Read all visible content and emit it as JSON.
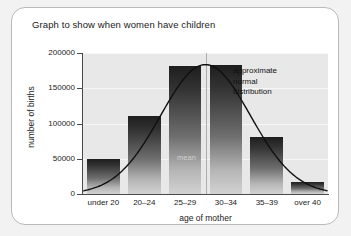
{
  "chart_data": {
    "type": "bar",
    "title": "Graph to show when women have children",
    "xlabel": "age of mother",
    "ylabel": "number of births",
    "categories": [
      "under 20",
      "20–24",
      "25–29",
      "30–34",
      "35–39",
      "over 40"
    ],
    "values": [
      49000,
      110000,
      182000,
      183000,
      81000,
      17000
    ],
    "ylim": [
      0,
      200000
    ],
    "ytick_labels": [
      "0",
      "50000",
      "100000",
      "150000",
      "200000"
    ],
    "ytick_values": [
      0,
      50000,
      100000,
      150000,
      200000
    ],
    "grid": true,
    "legend": "none",
    "series": [
      {
        "name": "number of births",
        "values": [
          49000,
          110000,
          182000,
          183000,
          81000,
          17000
        ]
      },
      {
        "name": "approximate normal distribution",
        "type": "line",
        "x": [
          "under 20",
          "20–24",
          "25–29",
          "30–34",
          "35–39",
          "over 40"
        ],
        "values": [
          3000,
          30000,
          130000,
          185000,
          95000,
          18000
        ]
      }
    ],
    "annotations": [
      {
        "name": "curve-annotation",
        "lines": [
          "approximate",
          "normal",
          "distribution"
        ],
        "text": "approximate normal distribution",
        "note": "partly hidden behind the 30–34 bar"
      },
      {
        "name": "mean-marker",
        "text": "mean"
      }
    ]
  },
  "chart": {
    "title": "Graph to show when women have children",
    "y_axis": {
      "title": "number of births",
      "ticks": [
        "0",
        "50000",
        "100000",
        "150000",
        "200000"
      ]
    },
    "x_axis": {
      "title": "age of mother",
      "ticks": [
        "under 20",
        "20–24",
        "25–29",
        "30–34",
        "35–39",
        "over 40"
      ]
    },
    "mean_label": "mean",
    "annotation": {
      "line1": "approximate",
      "line2": "normal",
      "line3": "distribution"
    },
    "colors": {
      "plot_background": "#e8e8e8",
      "bar_top": "#1e1e1e",
      "bar_bottom": "#d2d2d2",
      "curve": "#101010",
      "axis": "#4a4a4a",
      "mean_text": "#cfcfcf"
    }
  }
}
